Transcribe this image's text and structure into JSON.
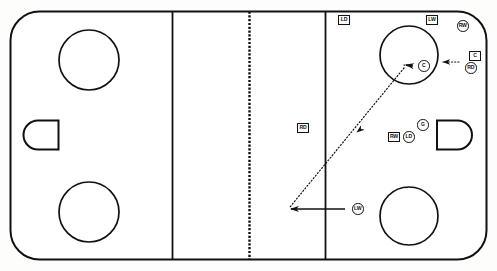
{
  "diagram": {
    "type": "ice-hockey-rink",
    "orientation": "horizontal",
    "colors": {
      "ink": "#111111",
      "surface": "#fdfdfc",
      "line": "#111111"
    }
  },
  "rink": {
    "boards_label": "rink-boards",
    "left_goal_crease_label": "left-goal-crease",
    "right_goal_crease_label": "right-goal-crease",
    "left_blue_line_label": "left-blue-line",
    "right_blue_line_label": "right-blue-line",
    "center_line_label": "center-red-line-dashed",
    "faceoff_circles": [
      {
        "name": "faceoff-circle-top-left",
        "cx": 89,
        "cy": 60,
        "r": 30
      },
      {
        "name": "faceoff-circle-bottom-left",
        "cx": 89,
        "cy": 212,
        "r": 30
      },
      {
        "name": "faceoff-circle-top-right",
        "cx": 409,
        "cy": 55,
        "r": 29
      },
      {
        "name": "faceoff-circle-bottom-right",
        "cx": 409,
        "cy": 216,
        "r": 29
      }
    ]
  },
  "players": [
    {
      "id": "ld-point",
      "label": "LD",
      "shape": "square",
      "x": 338,
      "y": 15,
      "name": "player-marker-ld-point"
    },
    {
      "id": "lw-high",
      "label": "LW",
      "shape": "square",
      "x": 426,
      "y": 15,
      "name": "player-marker-lw-high"
    },
    {
      "id": "rw-corner",
      "label": "RW",
      "shape": "circle",
      "x": 457,
      "y": 20,
      "name": "player-marker-rw-corner"
    },
    {
      "id": "c-target",
      "label": "C",
      "shape": "square",
      "x": 469,
      "y": 51,
      "name": "player-marker-c-target"
    },
    {
      "id": "rd-carrier",
      "label": "RD",
      "shape": "circle",
      "x": 465,
      "y": 62,
      "name": "player-marker-rd-carrier"
    },
    {
      "id": "c-slot",
      "label": "C",
      "shape": "circle",
      "x": 418,
      "y": 60,
      "name": "player-marker-c-slot"
    },
    {
      "id": "rd-neutral",
      "label": "RD",
      "shape": "square",
      "x": 297,
      "y": 123,
      "name": "player-marker-rd-neutral"
    },
    {
      "id": "rw-net-front",
      "label": "RW",
      "shape": "square",
      "x": 388,
      "y": 132,
      "name": "player-marker-rw-net-front"
    },
    {
      "id": "ld-net-front",
      "label": "LD",
      "shape": "circle",
      "x": 403,
      "y": 131,
      "name": "player-marker-ld-net-front"
    },
    {
      "id": "g-goalie",
      "label": "G",
      "shape": "circle",
      "x": 417,
      "y": 119,
      "name": "player-marker-g-goalie"
    },
    {
      "id": "lw-low",
      "label": "LW",
      "shape": "circle",
      "x": 352,
      "y": 203,
      "name": "player-marker-lw-low"
    }
  ],
  "movements": [
    {
      "id": "pass-rd-to-c",
      "style": "dotted",
      "name": "pass-path-rd-to-c",
      "description": "dotted pass from RD toward C in the slot"
    },
    {
      "id": "pass-c-to-lw",
      "style": "dotted",
      "name": "pass-path-c-to-lw",
      "description": "long dotted pass from the slot down to the low zone"
    },
    {
      "id": "skate-lw",
      "style": "solid",
      "name": "skate-path-lw-low",
      "description": "solid skating路 arrow for LW moving left"
    }
  ],
  "legend": {
    "square_meaning": "opposing / defending player",
    "circle_meaning": "attacking player",
    "dotted_meaning": "pass",
    "solid_meaning": "skate with puck"
  }
}
